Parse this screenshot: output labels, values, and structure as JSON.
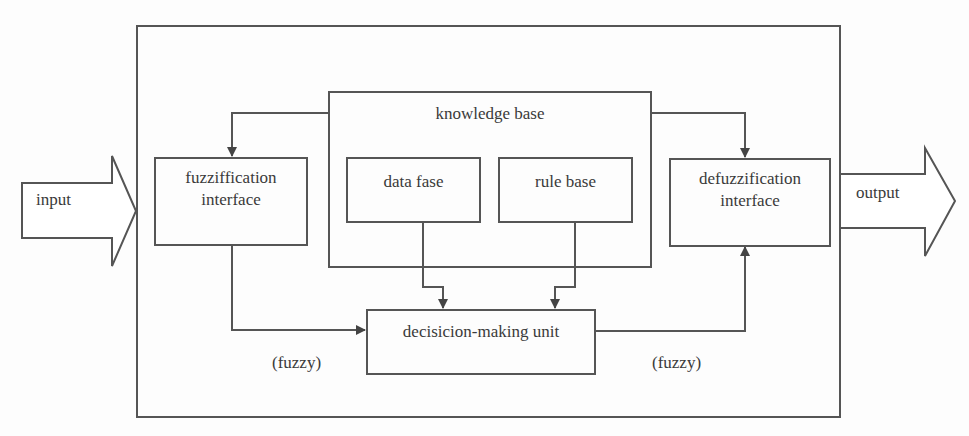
{
  "diagram": {
    "input_label": "input",
    "output_label": "output",
    "fuzzification": {
      "line1": "fuzziffication",
      "line2": "interface"
    },
    "knowledge_base": {
      "title": "knowledge base",
      "data_base": "data fase",
      "rule_base": "rule base"
    },
    "defuzzification": {
      "line1": "defuzzification",
      "line2": "interface"
    },
    "decision_unit": "decisicion-making unit",
    "fuzzy_left": "(fuzzy)",
    "fuzzy_right": "(fuzzy)"
  },
  "colors": {
    "stroke": "#555555",
    "text": "#3a3a3a",
    "background": "#fdfdfd"
  }
}
